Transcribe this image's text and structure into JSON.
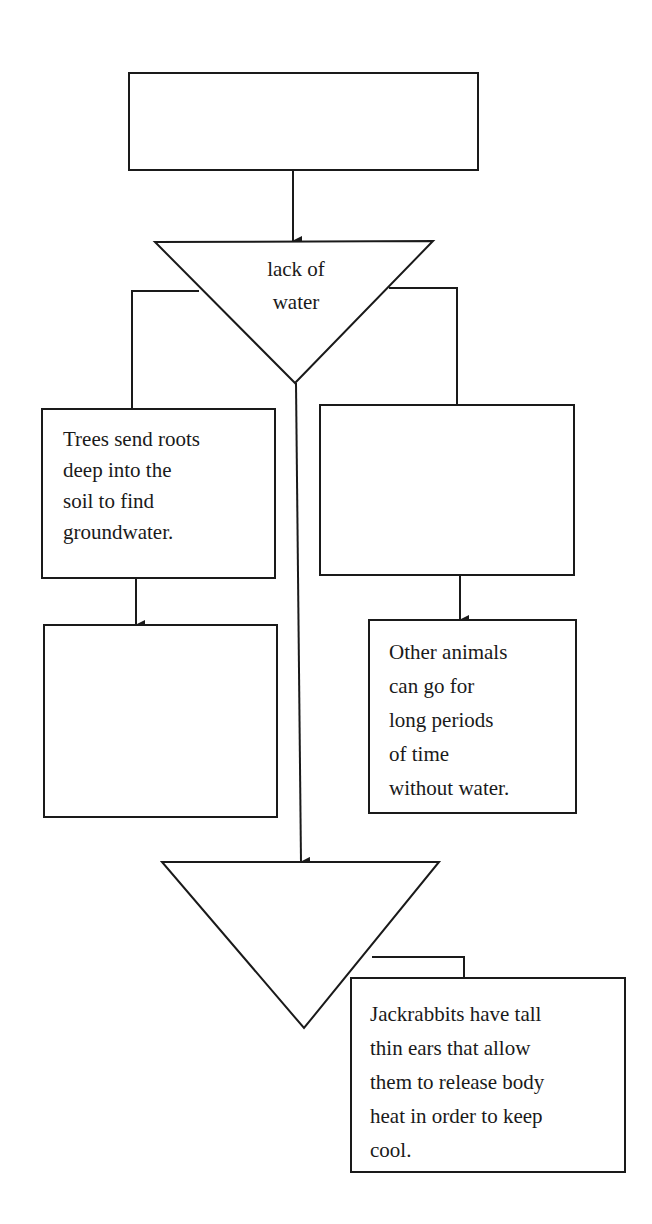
{
  "diagram": {
    "type": "flowchart",
    "stroke_color": "#1a1a1a",
    "background": "#ffffff",
    "nodes": {
      "top_box": {
        "shape": "rectangle",
        "text": ""
      },
      "triangle_1": {
        "shape": "inverted-triangle",
        "text": "lack of\nwater"
      },
      "left_box_1": {
        "shape": "rectangle",
        "text": "Trees send roots\ndeep into the\nsoil to find\ngroundwater."
      },
      "left_box_2": {
        "shape": "rectangle",
        "text": ""
      },
      "right_box_1": {
        "shape": "rectangle",
        "text": ""
      },
      "right_box_2": {
        "shape": "rectangle",
        "text": "Other animals\ncan go for\nlong periods\nof time\nwithout water."
      },
      "triangle_2": {
        "shape": "inverted-triangle",
        "text": ""
      },
      "bottom_box": {
        "shape": "rectangle",
        "text": "Jackrabbits have tall\nthin ears that allow\nthem to release body\nheat in order to keep\ncool."
      }
    },
    "edges": [
      {
        "from": "top_box",
        "to": "triangle_1",
        "arrow": true
      },
      {
        "from": "triangle_1",
        "to": "left_box_1",
        "arrow": false
      },
      {
        "from": "triangle_1",
        "to": "right_box_1",
        "arrow": false
      },
      {
        "from": "left_box_1",
        "to": "left_box_2",
        "arrow": true
      },
      {
        "from": "right_box_1",
        "to": "right_box_2",
        "arrow": true
      },
      {
        "from": "triangle_1",
        "to": "triangle_2",
        "arrow": true
      },
      {
        "from": "triangle_2",
        "to": "bottom_box",
        "arrow": false
      }
    ]
  }
}
